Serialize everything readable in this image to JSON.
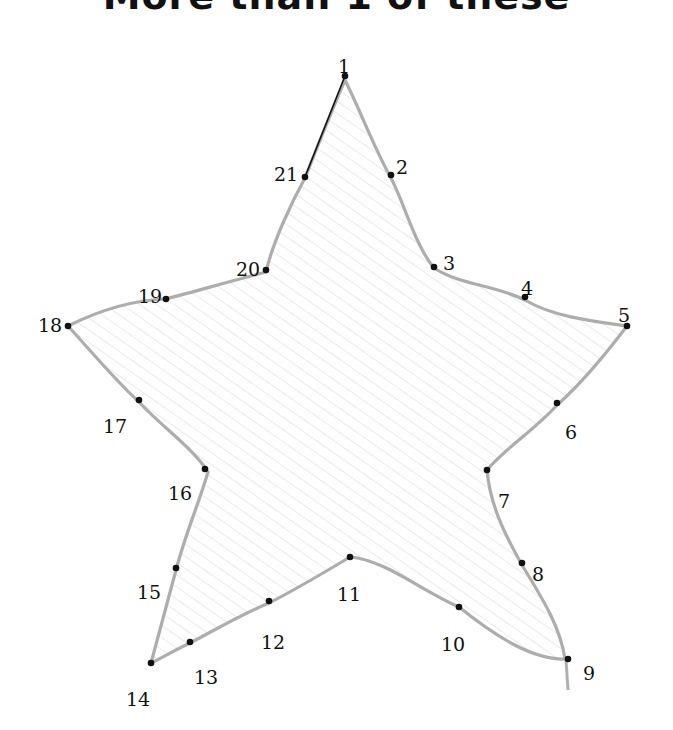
{
  "worksheet": {
    "title": "More than 1 of these",
    "instruction_type": "connect-the-dots",
    "shape": "star",
    "colors": {
      "outline": "#a9a9a9",
      "fill_scribble": "#d9d9d9",
      "dot": "#111111",
      "line": "#111111"
    },
    "dots": [
      {
        "n": "1",
        "x": 345,
        "y": 76,
        "lx": 338,
        "ly": 59
      },
      {
        "n": "2",
        "x": 391,
        "y": 175,
        "lx": 396,
        "ly": 160
      },
      {
        "n": "3",
        "x": 434,
        "y": 267,
        "lx": 443,
        "ly": 256
      },
      {
        "n": "4",
        "x": 525,
        "y": 297,
        "lx": 521,
        "ly": 281
      },
      {
        "n": "5",
        "x": 627,
        "y": 326,
        "lx": 618,
        "ly": 308
      },
      {
        "n": "6",
        "x": 557,
        "y": 403,
        "lx": 565,
        "ly": 425
      },
      {
        "n": "7",
        "x": 487,
        "y": 470,
        "lx": 498,
        "ly": 494
      },
      {
        "n": "8",
        "x": 522,
        "y": 563,
        "lx": 532,
        "ly": 567
      },
      {
        "n": "9",
        "x": 568,
        "y": 659,
        "lx": 583,
        "ly": 666
      },
      {
        "n": "10",
        "x": 459,
        "y": 607,
        "lx": 441,
        "ly": 637
      },
      {
        "n": "11",
        "x": 350,
        "y": 557,
        "lx": 337,
        "ly": 587
      },
      {
        "n": "12",
        "x": 269,
        "y": 601,
        "lx": 261,
        "ly": 635
      },
      {
        "n": "13",
        "x": 190,
        "y": 642,
        "lx": 194,
        "ly": 670
      },
      {
        "n": "14",
        "x": 151,
        "y": 663,
        "lx": 126,
        "ly": 692
      },
      {
        "n": "15",
        "x": 176,
        "y": 568,
        "lx": 137,
        "ly": 585
      },
      {
        "n": "16",
        "x": 205,
        "y": 469,
        "lx": 168,
        "ly": 486
      },
      {
        "n": "17",
        "x": 139,
        "y": 400,
        "lx": 103,
        "ly": 419
      },
      {
        "n": "18",
        "x": 68,
        "y": 326,
        "lx": 38,
        "ly": 318
      },
      {
        "n": "19",
        "x": 166,
        "y": 299,
        "lx": 138,
        "ly": 289
      },
      {
        "n": "20",
        "x": 266,
        "y": 270,
        "lx": 236,
        "ly": 262
      },
      {
        "n": "21",
        "x": 305,
        "y": 177,
        "lx": 274,
        "ly": 167
      }
    ],
    "drawn_line": {
      "from": "1",
      "to": "21"
    }
  }
}
